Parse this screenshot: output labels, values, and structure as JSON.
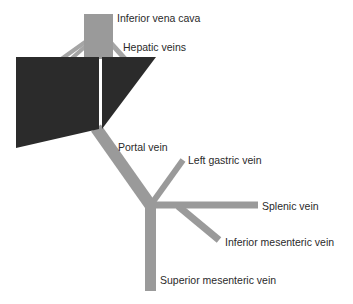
{
  "colors": {
    "vein": "#9a9a9a",
    "liver": "#2b2b2b",
    "text": "#2a2a2a"
  },
  "labels": {
    "ivc": "Inferior vena cava",
    "hepatic": "Hepatic veins",
    "portal": "Portal vein",
    "left_gastric": "Left gastric vein",
    "splenic": "Splenic vein",
    "imv": "Inferior mesenteric vein",
    "smv": "Superior mesenteric vein"
  }
}
